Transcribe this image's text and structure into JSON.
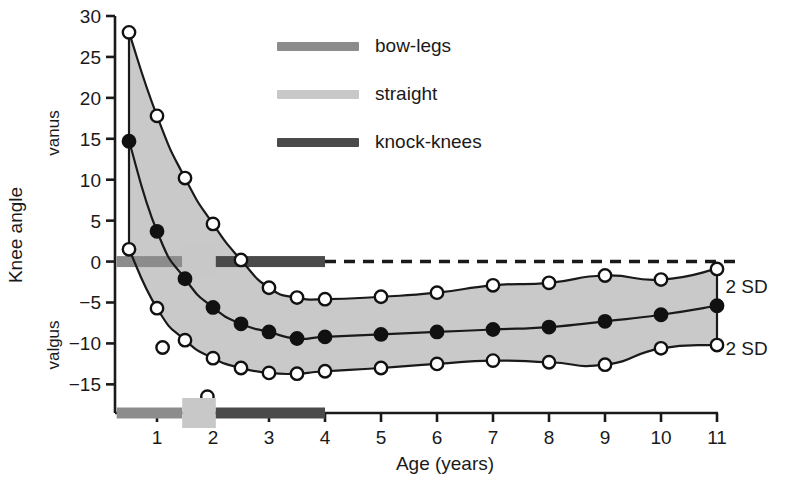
{
  "chart_data": {
    "type": "line",
    "title": "",
    "xlabel": "Age (years)",
    "ylabel": "Knee angle",
    "ylabel_top": "vanus",
    "ylabel_bottom": "valgus",
    "xlim": [
      0.25,
      11.0
    ],
    "ylim": [
      -18.5,
      30.0
    ],
    "grid": false,
    "xticks": [
      1,
      2,
      3,
      4,
      5,
      6,
      7,
      8,
      9,
      10,
      11
    ],
    "xtick_labels": [
      "1",
      "2",
      "3",
      "4",
      "5",
      "6",
      "7",
      "8",
      "9",
      "10",
      "11"
    ],
    "yticks": [
      30,
      25,
      20,
      15,
      10,
      5,
      0,
      -5,
      -10,
      -15
    ],
    "ytick_labels": [
      "30",
      "25",
      "20",
      "15",
      "10",
      "5",
      "0",
      "−5",
      "−10",
      "−15"
    ],
    "legend_position": "upper-center",
    "legend": [
      {
        "name": "bow-legs",
        "color": "#8c8c8c"
      },
      {
        "name": "straight",
        "color": "#c8c8c8"
      },
      {
        "name": "knock-knees",
        "color": "#4a4a4a"
      }
    ],
    "annotations": [
      {
        "text": "2 SD",
        "x": 11.15,
        "y": -3.0
      },
      {
        "text": "2 SD",
        "x": 11.15,
        "y": -10.5
      }
    ],
    "band_fill": "#c9c9c9",
    "series": [
      {
        "name": "upper 2 SD",
        "marker": "open-circle",
        "x": [
          0.5,
          1.0,
          1.5,
          2.0,
          2.5,
          3.0,
          3.5,
          4.0,
          5.0,
          6.0,
          7.0,
          8.0,
          9.0,
          10.0,
          11.0
        ],
        "values": [
          28.0,
          17.8,
          10.2,
          4.6,
          0.2,
          -3.2,
          -4.4,
          -4.6,
          -4.3,
          -3.8,
          -2.9,
          -2.6,
          -1.7,
          -2.2,
          -0.9
        ]
      },
      {
        "name": "mean",
        "marker": "filled-circle",
        "x": [
          0.5,
          1.0,
          1.5,
          2.0,
          2.5,
          3.0,
          3.5,
          4.0,
          5.0,
          6.0,
          7.0,
          8.0,
          9.0,
          10.0,
          11.0
        ],
        "values": [
          14.7,
          3.7,
          -2.1,
          -5.6,
          -7.6,
          -8.6,
          -9.4,
          -9.2,
          -8.9,
          -8.6,
          -8.3,
          -8.0,
          -7.3,
          -6.5,
          -5.4
        ]
      },
      {
        "name": "lower 2 SD",
        "marker": "open-circle",
        "x": [
          0.5,
          1.0,
          1.5,
          2.0,
          2.5,
          3.0,
          3.5,
          4.0,
          5.0,
          6.0,
          7.0,
          8.0,
          9.0,
          10.0,
          11.0
        ],
        "values": [
          1.5,
          -5.7,
          -9.6,
          -11.8,
          -13.0,
          -13.6,
          -13.7,
          -13.4,
          -13.0,
          -12.5,
          -12.1,
          -12.3,
          -12.6,
          -10.6,
          -10.2
        ]
      },
      {
        "name": "outliers",
        "marker": "open-circle",
        "x": [
          1.1,
          1.9
        ],
        "values": [
          -10.5,
          -16.5
        ]
      }
    ],
    "reference_line": {
      "y": 0,
      "style": "dashed",
      "x_start": 4.0,
      "x_end": 11.0
    },
    "status_bars": [
      {
        "label": "bow-legs",
        "color": "#8c8c8c",
        "x_start": 0.28,
        "x_end": 1.45
      },
      {
        "label": "straight",
        "color": "#c8c8c8",
        "x_start": 1.45,
        "x_end": 2.05
      },
      {
        "label": "knock-knees",
        "color": "#4a4a4a",
        "x_start": 2.05,
        "x_end": 4.0
      }
    ]
  }
}
